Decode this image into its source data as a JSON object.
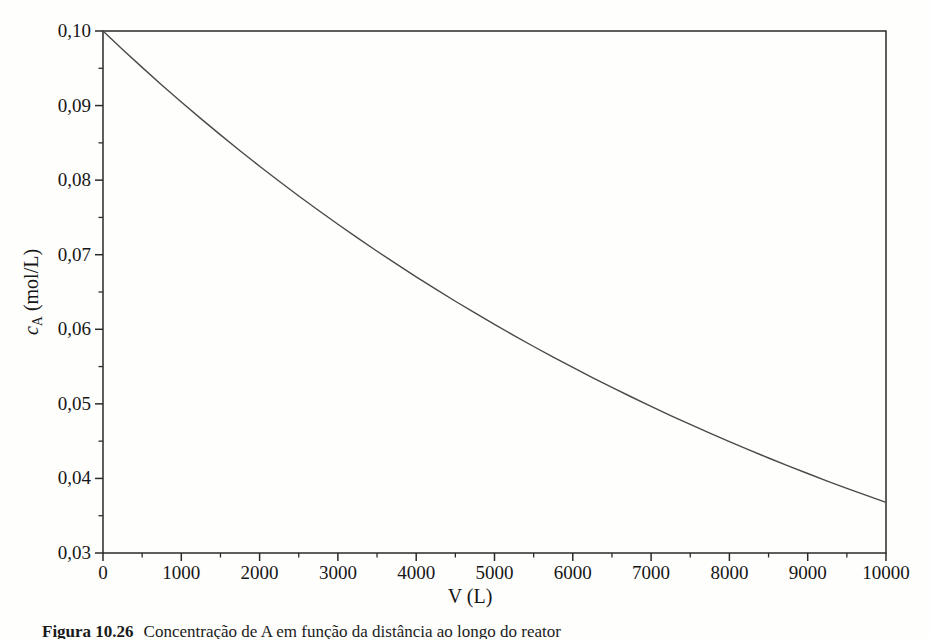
{
  "figure": {
    "caption": {
      "label": "Figura 10.26",
      "text": "Concentração de A em função da distância ao longo do reator"
    }
  },
  "chart_data": {
    "type": "line",
    "title": "",
    "xlabel": "V (L)",
    "ylabel": {
      "sym": "c",
      "sub": "A",
      "unit": " (mol/L)"
    },
    "xlim": [
      0,
      10000
    ],
    "ylim": [
      0.03,
      0.1
    ],
    "grid": false,
    "legend": "none",
    "decimal_separator": ",",
    "x_ticks": [
      {
        "v": 0,
        "label": "0"
      },
      {
        "v": 1000,
        "label": "1000"
      },
      {
        "v": 2000,
        "label": "2000"
      },
      {
        "v": 3000,
        "label": "3000"
      },
      {
        "v": 4000,
        "label": "4000"
      },
      {
        "v": 5000,
        "label": "5000"
      },
      {
        "v": 6000,
        "label": "6000"
      },
      {
        "v": 7000,
        "label": "7000"
      },
      {
        "v": 8000,
        "label": "8000"
      },
      {
        "v": 9000,
        "label": "9000"
      },
      {
        "v": 10000,
        "label": "10000"
      }
    ],
    "x_minor_step": 500,
    "y_ticks": [
      {
        "v": 0.03,
        "label": "0,03"
      },
      {
        "v": 0.04,
        "label": "0,04"
      },
      {
        "v": 0.05,
        "label": "0,05"
      },
      {
        "v": 0.06,
        "label": "0,06"
      },
      {
        "v": 0.07,
        "label": "0,07"
      },
      {
        "v": 0.08,
        "label": "0,08"
      },
      {
        "v": 0.09,
        "label": "0,09"
      },
      {
        "v": 0.1,
        "label": "0,10"
      }
    ],
    "y_minor_step": 0.005,
    "series": [
      {
        "name": "cA_vs_V",
        "model": "cA = 0.1·exp(-V/10000)",
        "x": [
          0,
          250,
          500,
          750,
          1000,
          1250,
          1500,
          1750,
          2000,
          2250,
          2500,
          2750,
          3000,
          3250,
          3500,
          3750,
          4000,
          4250,
          4500,
          4750,
          5000,
          5250,
          5500,
          5750,
          6000,
          6250,
          6500,
          6750,
          7000,
          7250,
          7500,
          7750,
          8000,
          8250,
          8500,
          8750,
          9000,
          9250,
          9500,
          9750,
          10000
        ],
        "y": [
          0.1,
          0.09753,
          0.09512,
          0.09277,
          0.09048,
          0.08825,
          0.08607,
          0.08395,
          0.08187,
          0.07985,
          0.07788,
          0.07596,
          0.07408,
          0.07225,
          0.07047,
          0.06873,
          0.06703,
          0.06538,
          0.06376,
          0.06219,
          0.06065,
          0.05916,
          0.05769,
          0.05627,
          0.05488,
          0.05353,
          0.0522,
          0.05092,
          0.04966,
          0.04843,
          0.04724,
          0.04607,
          0.04493,
          0.04382,
          0.04274,
          0.04169,
          0.04066,
          0.03965,
          0.03867,
          0.03772,
          0.03679
        ]
      }
    ],
    "colors": {
      "axis": "#2a2a2a",
      "curve": "#4a4a4a",
      "text": "#161616",
      "background": "#fefefd"
    }
  }
}
